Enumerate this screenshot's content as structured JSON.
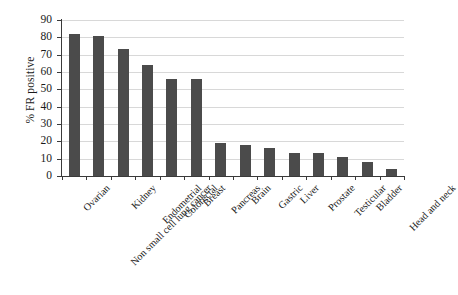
{
  "chart_data": {
    "type": "bar",
    "title": "",
    "xlabel": "",
    "ylabel": "% FR positive",
    "ylim": [
      0,
      90
    ],
    "yticks": [
      0,
      10,
      20,
      30,
      40,
      50,
      60,
      70,
      80,
      90
    ],
    "grid": true,
    "legend": false,
    "bar_color": "#4b4b4b",
    "categories": [
      "Ovarian",
      "Non small cell lung cancer",
      "Kidney",
      "Endometrial",
      "Colorectal",
      "Breast",
      "Pancreas",
      "Brain",
      "Gastric",
      "Liver",
      "Prostate",
      "Testicular",
      "Bladder",
      "Head and neck"
    ],
    "values": [
      82,
      81,
      73,
      64,
      56,
      56,
      19,
      18,
      16,
      13,
      13,
      11,
      8,
      4
    ]
  },
  "axis": {
    "y_title": "% FR positive",
    "y_tick_labels": [
      "0",
      "10",
      "20",
      "30",
      "40",
      "50",
      "60",
      "70",
      "80",
      "90"
    ]
  }
}
